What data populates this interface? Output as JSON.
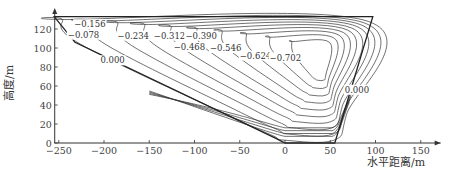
{
  "chart_data": {
    "type": "contour",
    "title": "",
    "xlabel": "水平距离/m",
    "ylabel": "高度/m",
    "xlim": [
      -255,
      175
    ],
    "ylim": [
      0,
      140
    ],
    "x_ticks": [
      -250,
      -200,
      -150,
      -100,
      -50,
      0,
      50,
      100,
      150
    ],
    "x_tick_labels": [
      "−250",
      "−200",
      "−150",
      "−100",
      "−50",
      "0",
      "50",
      "100",
      "150"
    ],
    "y_ticks": [
      0,
      20,
      40,
      60,
      80,
      100,
      120
    ],
    "y_tick_labels": [
      "0",
      "20",
      "40",
      "60",
      "80",
      "100",
      "120"
    ],
    "grid": false,
    "legend": null,
    "boundary_polygon": [
      [
        -255,
        133
      ],
      [
        -232,
        106
      ],
      [
        -10,
        5
      ],
      [
        0,
        0
      ],
      [
        55,
        0
      ],
      [
        97,
        133
      ]
    ],
    "contour_levels": [
      0.0,
      -0.078,
      -0.156,
      -0.234,
      -0.312,
      -0.39,
      -0.468,
      -0.546,
      -0.624,
      -0.702
    ],
    "contour_labels": [
      {
        "text": "−0.156",
        "x": -233,
        "y": 125
      },
      {
        "text": "−0.078",
        "x": -240,
        "y": 114
      },
      {
        "text": "−0.234",
        "x": -185,
        "y": 113
      },
      {
        "text": "−0.312",
        "x": -145,
        "y": 113
      },
      {
        "text": "−0.390",
        "x": -110,
        "y": 113
      },
      {
        "text": "−0.468",
        "x": -123,
        "y": 101
      },
      {
        "text": "−0.546",
        "x": -83,
        "y": 100
      },
      {
        "text": "−0.624",
        "x": -50,
        "y": 92
      },
      {
        "text": "−0.702",
        "x": -17,
        "y": 90
      },
      {
        "text": "0.000",
        "x": -204,
        "y": 87
      },
      {
        "text": "0.000",
        "x": 66,
        "y": 56
      }
    ],
    "minimum_region": {
      "x": 40,
      "y": 80,
      "value": "< −0.702"
    }
  }
}
